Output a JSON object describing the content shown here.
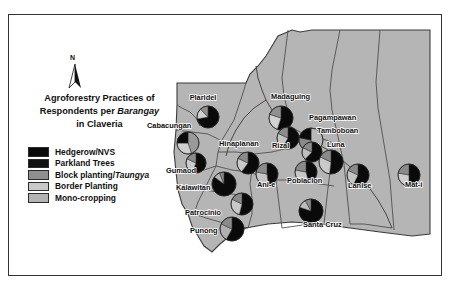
{
  "figure": {
    "title_line1": "Agroforestry Practices of",
    "title_line2_a": "Respondents per ",
    "title_line2_ital": "Barangay",
    "title_line3": "in Claveria",
    "north_letter": "N"
  },
  "legend": {
    "items": [
      {
        "label": "Hedgerow/NVS",
        "color": "#0a0a0a",
        "italic_part": ""
      },
      {
        "label": "Parkland Trees",
        "color": "#111111",
        "italic_part": ""
      },
      {
        "label_plain": "Block planting/",
        "label_italic": "Taungya",
        "color": "#8f8f8f"
      },
      {
        "label": "Border Planting",
        "color": "#c9c9c9",
        "italic_part": ""
      },
      {
        "label": "Mono-cropping",
        "color": "#b3b3b3",
        "italic_part": ""
      }
    ]
  },
  "map": {
    "land_fill": "#b5b5b5",
    "boundary_color": "#4a4a4a",
    "barangays": [
      {
        "name": "Plaridel",
        "lx": 203,
        "ly": 100,
        "anchor": "middle",
        "cx": 208,
        "cy": 117,
        "r": 11,
        "slices": [
          {
            "color": "#0a0a0a",
            "pct": 72
          },
          {
            "color": "#d0d0d0",
            "pct": 16
          },
          {
            "color": "#8f8f8f",
            "pct": 12
          }
        ]
      },
      {
        "name": "Cabacungan",
        "lx": 147,
        "ly": 128,
        "anchor": "start",
        "cx": 188,
        "cy": 143,
        "r": 11,
        "slices": [
          {
            "color": "#9a9a9a",
            "pct": 45
          },
          {
            "color": "#cfcfcf",
            "pct": 30
          },
          {
            "color": "#0a0a0a",
            "pct": 25
          }
        ]
      },
      {
        "name": "Hinaplanan",
        "lx": 219,
        "ly": 146,
        "anchor": "start",
        "cx": 248,
        "cy": 163,
        "r": 11,
        "slices": [
          {
            "color": "#0a0a0a",
            "pct": 60
          },
          {
            "color": "#c9c9c9",
            "pct": 22
          },
          {
            "color": "#8a8a8a",
            "pct": 18
          }
        ]
      },
      {
        "name": "Madaguing",
        "lx": 271,
        "ly": 99,
        "anchor": "start",
        "cx": 281,
        "cy": 118,
        "r": 12,
        "slices": [
          {
            "color": "#0a0a0a",
            "pct": 55
          },
          {
            "color": "#d2d2d2",
            "pct": 25
          },
          {
            "color": "#909090",
            "pct": 20
          }
        ]
      },
      {
        "name": "Rizal",
        "lx": 272,
        "ly": 148,
        "anchor": "start",
        "cx": 288,
        "cy": 138,
        "r": 11,
        "slices": [
          {
            "color": "#0a0a0a",
            "pct": 58
          },
          {
            "color": "#c4c4c4",
            "pct": 24
          },
          {
            "color": "#8c8c8c",
            "pct": 18
          }
        ]
      },
      {
        "name": "Pagampawan",
        "lx": 309,
        "ly": 120,
        "anchor": "start",
        "cx": 311,
        "cy": 140,
        "r": 12,
        "slices": [
          {
            "color": "#b8b8b8",
            "pct": 50
          },
          {
            "color": "#8a8a8a",
            "pct": 28
          },
          {
            "color": "#0a0a0a",
            "pct": 22
          }
        ]
      },
      {
        "name": "Tamboboan",
        "lx": 317,
        "ly": 133,
        "anchor": "start",
        "cx": 312,
        "cy": 152,
        "r": 10,
        "slices": [
          {
            "color": "#0a0a0a",
            "pct": 62
          },
          {
            "color": "#bdbdbd",
            "pct": 20
          },
          {
            "color": "#8a8a8a",
            "pct": 18
          }
        ]
      },
      {
        "name": "Luna",
        "lx": 327,
        "ly": 147,
        "anchor": "start",
        "cx": 331,
        "cy": 162,
        "r": 12,
        "slices": [
          {
            "color": "#0a0a0a",
            "pct": 52
          },
          {
            "color": "#c9c9c9",
            "pct": 30
          },
          {
            "color": "#8a8a8a",
            "pct": 18
          }
        ]
      },
      {
        "name": "Gumaod",
        "lx": 166,
        "ly": 173,
        "anchor": "start",
        "cx": 196,
        "cy": 163,
        "r": 10,
        "slices": [
          {
            "color": "#0a0a0a",
            "pct": 56
          },
          {
            "color": "#cbcbcb",
            "pct": 26
          },
          {
            "color": "#8a8a8a",
            "pct": 18
          }
        ]
      },
      {
        "name": "Kalawitan",
        "lx": 176,
        "ly": 190,
        "anchor": "start",
        "cx": 224,
        "cy": 184,
        "r": 12,
        "slices": [
          {
            "color": "#0a0a0a",
            "pct": 85
          },
          {
            "color": "#b5b5b5",
            "pct": 9
          },
          {
            "color": "#8a8a8a",
            "pct": 6
          }
        ]
      },
      {
        "name": "Ani-e",
        "lx": 257,
        "ly": 187,
        "anchor": "start",
        "cx": 267,
        "cy": 174,
        "r": 11,
        "slices": [
          {
            "color": "#0a0a0a",
            "pct": 48
          },
          {
            "color": "#c6c6c6",
            "pct": 30
          },
          {
            "color": "#8a8a8a",
            "pct": 22
          }
        ]
      },
      {
        "name": "Poblacion",
        "lx": 287,
        "ly": 183,
        "anchor": "start",
        "cx": 306,
        "cy": 172,
        "r": 11,
        "slices": [
          {
            "color": "#0a0a0a",
            "pct": 46
          },
          {
            "color": "#c8c8c8",
            "pct": 32
          },
          {
            "color": "#8a8a8a",
            "pct": 22
          }
        ]
      },
      {
        "name": "Lanise",
        "lx": 348,
        "ly": 188,
        "anchor": "start",
        "cx": 358,
        "cy": 175,
        "r": 11,
        "slices": [
          {
            "color": "#0a0a0a",
            "pct": 57
          },
          {
            "color": "#c4c4c4",
            "pct": 25
          },
          {
            "color": "#8a8a8a",
            "pct": 18
          }
        ]
      },
      {
        "name": "Mat-i",
        "lx": 405,
        "ly": 187,
        "anchor": "start",
        "cx": 409,
        "cy": 175,
        "r": 11,
        "slices": [
          {
            "color": "#0a0a0a",
            "pct": 50
          },
          {
            "color": "#cdcdcd",
            "pct": 28
          },
          {
            "color": "#8a8a8a",
            "pct": 22
          }
        ]
      },
      {
        "name": "Patrocinio",
        "lx": 185,
        "ly": 215,
        "anchor": "start",
        "cx": 242,
        "cy": 204,
        "r": 11,
        "slices": [
          {
            "color": "#0a0a0a",
            "pct": 54
          },
          {
            "color": "#c9c9c9",
            "pct": 28
          },
          {
            "color": "#8a8a8a",
            "pct": 18
          }
        ]
      },
      {
        "name": "Punong",
        "lx": 190,
        "ly": 233,
        "anchor": "start",
        "cx": 232,
        "cy": 229,
        "r": 12,
        "slices": [
          {
            "color": "#0a0a0a",
            "pct": 58
          },
          {
            "color": "#b0b0b0",
            "pct": 24
          },
          {
            "color": "#8a8a8a",
            "pct": 18
          }
        ]
      },
      {
        "name": "Santa Cruz",
        "lx": 303,
        "ly": 227,
        "anchor": "start",
        "cx": 311,
        "cy": 211,
        "r": 12,
        "slices": [
          {
            "color": "#0a0a0a",
            "pct": 80
          },
          {
            "color": "#bdbdbd",
            "pct": 12
          },
          {
            "color": "#8a8a8a",
            "pct": 8
          }
        ]
      }
    ]
  }
}
